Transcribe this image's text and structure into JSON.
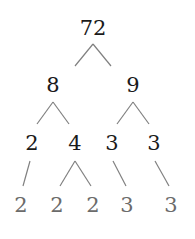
{
  "diagram": {
    "type": "factor-tree",
    "colors": {
      "line": "#808080",
      "node_text": "#1a1a1a",
      "leaf_text": "#6b6b6b"
    },
    "nodes": [
      {
        "id": "n72",
        "label": "72",
        "x": 93,
        "y": 28,
        "style": "dark"
      },
      {
        "id": "n8",
        "label": "8",
        "x": 53,
        "y": 85,
        "style": "dark"
      },
      {
        "id": "n9",
        "label": "9",
        "x": 133,
        "y": 85,
        "style": "dark"
      },
      {
        "id": "n2a",
        "label": "2",
        "x": 32,
        "y": 143,
        "style": "dark"
      },
      {
        "id": "n4",
        "label": "4",
        "x": 75,
        "y": 143,
        "style": "dark"
      },
      {
        "id": "n3a",
        "label": "3",
        "x": 112,
        "y": 143,
        "style": "dark"
      },
      {
        "id": "n3b",
        "label": "3",
        "x": 154,
        "y": 143,
        "style": "dark"
      },
      {
        "id": "l2a",
        "label": "2",
        "x": 21,
        "y": 205,
        "style": "grey"
      },
      {
        "id": "l2b",
        "label": "2",
        "x": 57,
        "y": 205,
        "style": "grey"
      },
      {
        "id": "l2c",
        "label": "2",
        "x": 93,
        "y": 205,
        "style": "grey"
      },
      {
        "id": "l3a",
        "label": "3",
        "x": 127,
        "y": 205,
        "style": "grey"
      },
      {
        "id": "l3b",
        "label": "3",
        "x": 171,
        "y": 205,
        "style": "grey"
      }
    ],
    "edges": [
      {
        "from": "72",
        "to": "8",
        "x1": 93,
        "y1": 44,
        "x2": 75,
        "y2": 66
      },
      {
        "from": "72",
        "to": "9",
        "x1": 93,
        "y1": 44,
        "x2": 111,
        "y2": 66
      },
      {
        "from": "8",
        "to": "2",
        "x1": 53,
        "y1": 102,
        "x2": 37,
        "y2": 124
      },
      {
        "from": "8",
        "to": "4",
        "x1": 53,
        "y1": 102,
        "x2": 69,
        "y2": 124
      },
      {
        "from": "9",
        "to": "3",
        "x1": 133,
        "y1": 102,
        "x2": 117,
        "y2": 124
      },
      {
        "from": "9",
        "to": "3",
        "x1": 133,
        "y1": 102,
        "x2": 149,
        "y2": 124
      },
      {
        "from": "2",
        "to": "2",
        "x1": 30,
        "y1": 161,
        "x2": 23,
        "y2": 186
      },
      {
        "from": "4",
        "to": "2",
        "x1": 75,
        "y1": 161,
        "x2": 60,
        "y2": 186
      },
      {
        "from": "4",
        "to": "2",
        "x1": 75,
        "y1": 161,
        "x2": 91,
        "y2": 186
      },
      {
        "from": "3",
        "to": "3",
        "x1": 113,
        "y1": 161,
        "x2": 126,
        "y2": 186
      },
      {
        "from": "3",
        "to": "3",
        "x1": 155,
        "y1": 161,
        "x2": 169,
        "y2": 186
      }
    ]
  }
}
